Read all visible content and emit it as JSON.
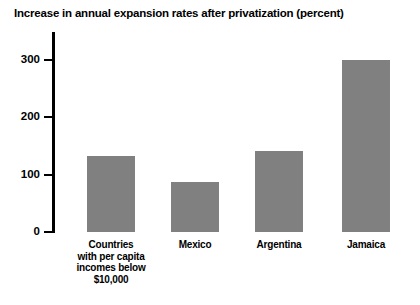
{
  "chart_data": {
    "type": "bar",
    "title": "Increase in annual expansion rates after privatization (percent)",
    "xlabel": "",
    "ylabel": "",
    "categories": [
      "Countries with per capita incomes below $10,000",
      "Mexico",
      "Argentina",
      "Jamaica"
    ],
    "category_lines": [
      [
        "Countries",
        "with per capita",
        "incomes below",
        "$10,000"
      ],
      [
        "Mexico"
      ],
      [
        "Argentina"
      ],
      [
        "Jamaica"
      ]
    ],
    "values": [
      132,
      88,
      142,
      300
    ],
    "ylim": [
      0,
      300
    ],
    "yticks": [
      0,
      100,
      200,
      300
    ],
    "ytick_labels": [
      "0",
      "100",
      "200",
      "300"
    ],
    "grid": false,
    "legend": false,
    "bar_color": "#808080",
    "axis_color": "#000000",
    "background_color": "#ffffff"
  }
}
